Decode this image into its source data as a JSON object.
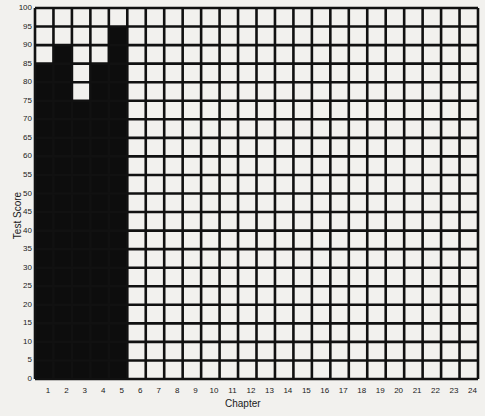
{
  "chart_data": {
    "type": "bar",
    "title": "",
    "xlabel": "Chapter",
    "ylabel": "Test Score",
    "categories": [
      "1",
      "2",
      "3",
      "4",
      "5",
      "6",
      "7",
      "8",
      "9",
      "10",
      "11",
      "12",
      "13",
      "14",
      "15",
      "16",
      "17",
      "18",
      "19",
      "20",
      "21",
      "22",
      "23",
      "24"
    ],
    "values": [
      85,
      90,
      75,
      85,
      95,
      null,
      null,
      null,
      null,
      null,
      null,
      null,
      null,
      null,
      null,
      null,
      null,
      null,
      null,
      null,
      null,
      null,
      null,
      null
    ],
    "ylim": [
      0,
      100
    ],
    "yticks": [
      0,
      5,
      10,
      15,
      20,
      25,
      30,
      35,
      40,
      45,
      50,
      55,
      60,
      65,
      70,
      75,
      80,
      85,
      90,
      95,
      100
    ],
    "grid": true,
    "legend": null,
    "colors": {
      "bar": "#0d0d0d",
      "grid": "#111111",
      "cell": "#f2f1ee"
    }
  },
  "axes": {
    "xlabel": "Chapter",
    "ylabel": "Test Score"
  }
}
